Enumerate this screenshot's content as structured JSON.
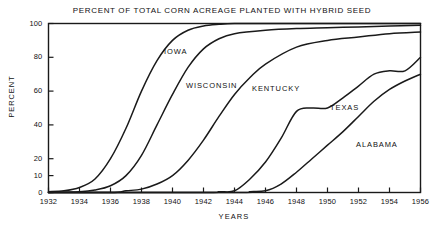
{
  "chart_data": {
    "type": "line",
    "title": "PERCENT OF TOTAL CORN ACREAGE PLANTED WITH HYBRID SEED",
    "xlabel": "YEARS",
    "ylabel": "PERCENT",
    "xlim": [
      1932,
      1956
    ],
    "ylim": [
      0,
      100
    ],
    "grid": false,
    "legend_position": "inline-annotations",
    "xticks": [
      "1932",
      "1934",
      "1936",
      "1938",
      "1940",
      "1942",
      "1944",
      "1946",
      "1948",
      "1950",
      "1952",
      "1954",
      "1956"
    ],
    "yticks": [
      "0",
      "10",
      "20",
      "40",
      "60",
      "80",
      "100"
    ],
    "series": [
      {
        "name": "IOWA",
        "x": [
          1932,
          1933,
          1934,
          1935,
          1936,
          1937,
          1938,
          1939,
          1940,
          1941,
          1942,
          1943,
          1944,
          1946,
          1948,
          1950,
          1952,
          1954,
          1956
        ],
        "values": [
          0.5,
          1,
          3,
          8,
          20,
          38,
          60,
          78,
          90,
          96,
          98.5,
          99.5,
          100,
          100,
          100,
          100,
          100,
          100,
          100
        ]
      },
      {
        "name": "WISCONSIN",
        "x": [
          1932,
          1934,
          1935,
          1936,
          1937,
          1938,
          1939,
          1940,
          1941,
          1942,
          1943,
          1944,
          1946,
          1948,
          1950,
          1952,
          1954,
          1956
        ],
        "values": [
          0,
          0.5,
          1.5,
          4,
          10,
          22,
          40,
          58,
          74,
          85,
          91,
          94,
          96,
          97,
          97.5,
          98,
          98.5,
          99
        ]
      },
      {
        "name": "KENTUCKY",
        "x": [
          1932,
          1936,
          1937,
          1938,
          1939,
          1940,
          1941,
          1942,
          1943,
          1944,
          1945,
          1946,
          1948,
          1950,
          1952,
          1954,
          1956
        ],
        "values": [
          0,
          0,
          1,
          2,
          5,
          10,
          19,
          31,
          45,
          58,
          68,
          76,
          86,
          90,
          92,
          94,
          95
        ]
      },
      {
        "name": "TEXAS",
        "x": [
          1932,
          1942,
          1943,
          1944,
          1945,
          1946,
          1947,
          1948,
          1949,
          1950,
          1951,
          1952,
          1953,
          1954,
          1955,
          1956
        ],
        "values": [
          0,
          0,
          0.5,
          1,
          8,
          18,
          32,
          48,
          50,
          50,
          56,
          63,
          70,
          72,
          72,
          80
        ]
      },
      {
        "name": "ALABAMA",
        "x": [
          1932,
          1944,
          1945,
          1946,
          1947,
          1948,
          1949,
          1950,
          1951,
          1952,
          1953,
          1954,
          1955,
          1956
        ],
        "values": [
          0,
          0,
          0.5,
          1,
          5,
          12,
          20,
          28,
          36,
          45,
          54,
          61,
          66,
          70
        ]
      }
    ],
    "annotations": [
      {
        "text": "IOWA",
        "x_px": 164,
        "y_px": 47
      },
      {
        "text": "WISCONSIN",
        "x_px": 186,
        "y_px": 81
      },
      {
        "text": "KENTUCKY",
        "x_px": 252,
        "y_px": 84
      },
      {
        "text": "TEXAS",
        "x_px": 330,
        "y_px": 103
      },
      {
        "text": "ALABAMA",
        "x_px": 356,
        "y_px": 140
      }
    ],
    "style": {
      "line_color": "#1a1a1a",
      "background": "#ffffff",
      "frame_color": "#1a1a1a"
    }
  }
}
